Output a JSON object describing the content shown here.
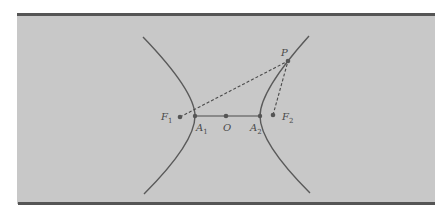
{
  "figure": {
    "type": "hyperbola-diagram",
    "colors": {
      "panel_bg": "#c8c8c8",
      "border": "#555555",
      "curve": "#5a5a5a",
      "dashed": "#4a4a4a",
      "point": "#555555"
    }
  },
  "labels": {
    "P": {
      "main": "P",
      "sub": ""
    },
    "F1": {
      "main": "F",
      "sub": "1"
    },
    "F2": {
      "main": "F",
      "sub": "2"
    },
    "A1": {
      "main": "A",
      "sub": "1"
    },
    "A2": {
      "main": "A",
      "sub": "2"
    },
    "O": {
      "main": "O",
      "sub": ""
    }
  },
  "points": {
    "F1": [
      180,
      117
    ],
    "A1": [
      195,
      116
    ],
    "O": [
      226,
      116
    ],
    "A2": [
      260,
      116
    ],
    "F2": [
      273,
      115
    ],
    "P": [
      288,
      61
    ]
  },
  "segments": {
    "transverse_axis": "A1-A2 (solid)",
    "PF1": "dashed",
    "PF2": "dashed"
  }
}
